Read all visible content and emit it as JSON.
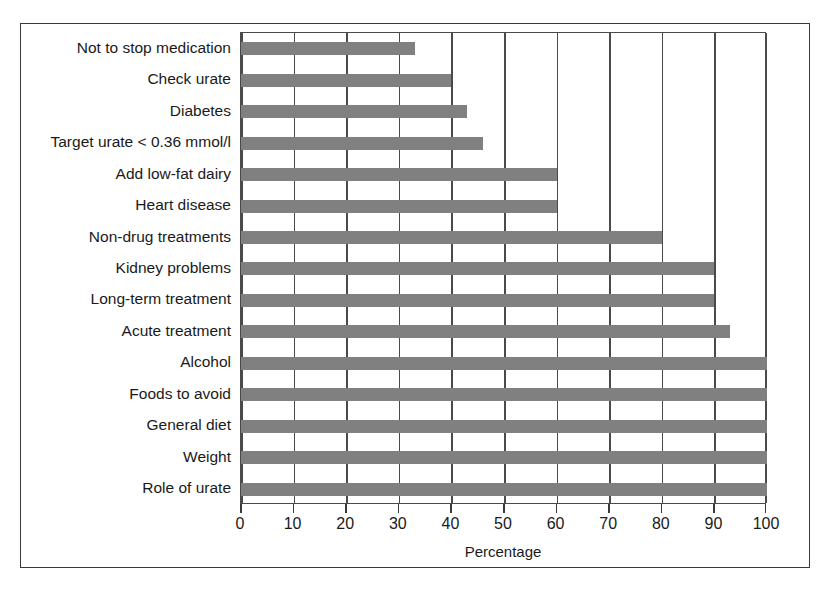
{
  "chart_data": {
    "type": "bar",
    "orientation": "horizontal",
    "title": "",
    "xlabel": "Percentage",
    "ylabel": "",
    "xlim": [
      0,
      100
    ],
    "xticks": [
      0,
      10,
      20,
      30,
      40,
      50,
      60,
      70,
      80,
      90,
      100
    ],
    "grid": true,
    "legend": null,
    "bar_color": "#808080",
    "frame_color": "#3a3a3a",
    "categories": [
      "Not to stop medication",
      "Check urate",
      "Diabetes",
      "Target urate < 0.36 mmol/l",
      "Add low-fat dairy",
      "Heart disease",
      "Non-drug treatments",
      "Kidney problems",
      "Long-term treatment",
      "Acute treatment",
      "Alcohol",
      "Foods to avoid",
      "General diet",
      "Weight",
      "Role of urate"
    ],
    "values": [
      33,
      40,
      43,
      46,
      60,
      60,
      80,
      90,
      90,
      93,
      100,
      100,
      100,
      100,
      100
    ]
  }
}
